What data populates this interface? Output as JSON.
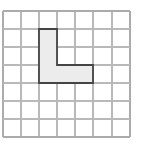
{
  "figure": {
    "background_color": "#ffffff",
    "width": 144,
    "height": 144
  },
  "grid": {
    "columns": 7,
    "rows": 7,
    "cell_size": 18,
    "origin_x": 3,
    "origin_y": 11,
    "line_color": "#b9b9b9",
    "edge_line_color": "#ababab",
    "x_lines": [
      3,
      21,
      39,
      57,
      75,
      93,
      112,
      130
    ],
    "y_lines": [
      11,
      29,
      47,
      65,
      83,
      101,
      119,
      137
    ]
  },
  "shape": {
    "name": "L-shape",
    "cell_count": 5,
    "fill_color": "#ececec",
    "outline_color": "#444444",
    "outline_width": 1.8,
    "cells": [
      {
        "col": 2,
        "row": 1
      },
      {
        "col": 2,
        "row": 2
      },
      {
        "col": 2,
        "row": 3
      },
      {
        "col": 3,
        "row": 3
      },
      {
        "col": 4,
        "row": 3
      }
    ],
    "outline_points": "39,29 57,29 57,65 93,65 93,83 39,83 39,29",
    "bounds": {
      "left": 39,
      "top": 29,
      "right": 93,
      "bottom": 83
    }
  }
}
